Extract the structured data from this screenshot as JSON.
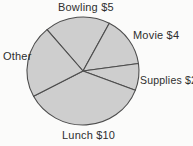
{
  "chart_data": {
    "type": "pie",
    "title": "",
    "legend": "none",
    "labels_position": "outside",
    "slices": [
      {
        "id": "bowling",
        "label": "Bowling $5",
        "value": 5,
        "start_deg": 130,
        "end_deg": 62
      },
      {
        "id": "movie",
        "label": "Movie $4",
        "value": 4,
        "start_deg": 62,
        "end_deg": 8
      },
      {
        "id": "supplies",
        "label": "Supplies $2",
        "value": 2,
        "start_deg": 8,
        "end_deg": 339
      },
      {
        "id": "lunch",
        "label": "Lunch $10",
        "value": 10,
        "start_deg": 339,
        "end_deg": 208
      },
      {
        "id": "other",
        "label": "Other",
        "value": null,
        "start_deg": 208,
        "end_deg": 130
      }
    ],
    "colors": {
      "slice_fill": "#cecece",
      "slice_stroke": "#4d4d4d",
      "label_text": "#2e2e2e",
      "background": "#fbfbfa"
    }
  }
}
